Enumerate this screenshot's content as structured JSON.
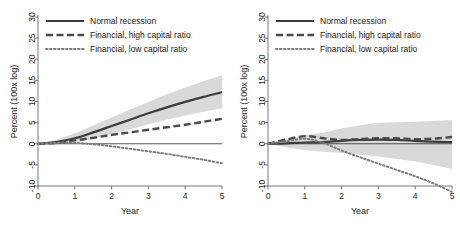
{
  "figure": {
    "panels": [
      {
        "name": "left-panel",
        "legend": [
          {
            "label": "Normal recession",
            "style": "solid"
          },
          {
            "label": "Financial, high capital ratio",
            "style": "dashed"
          },
          {
            "label": "Financial, low capital ratio",
            "style": "dotted"
          }
        ],
        "axes": {
          "xlabel": "Year",
          "ylabel": "Percent (100x log)",
          "xticks": [
            "0",
            "1",
            "2",
            "3",
            "4",
            "5"
          ],
          "yticks": [
            "-10",
            "-5",
            "0",
            "5",
            "10",
            "15",
            "20",
            "25",
            "30"
          ]
        }
      },
      {
        "name": "right-panel",
        "legend": [
          {
            "label": "Normal recession",
            "style": "solid"
          },
          {
            "label": "Financial, high capital ratio",
            "style": "dashed"
          },
          {
            "label": "Financial, low capital ratio",
            "style": "dotted"
          }
        ],
        "axes": {
          "xlabel": "Year",
          "ylabel": "Percent (100x log)",
          "xticks": [
            "0",
            "1",
            "2",
            "3",
            "4",
            "5"
          ],
          "yticks": [
            "-10",
            "-5",
            "0",
            "5",
            "10",
            "15",
            "20",
            "25",
            "30"
          ]
        }
      }
    ]
  },
  "chart_data": [
    {
      "type": "line",
      "panel": "left",
      "title": "",
      "xlabel": "Year",
      "ylabel": "Percent (100x log)",
      "xlim": [
        0,
        5
      ],
      "ylim": [
        -10,
        30
      ],
      "xticks": [
        0,
        1,
        2,
        3,
        4,
        5
      ],
      "yticks": [
        -10,
        -5,
        0,
        5,
        10,
        15,
        20,
        25,
        30
      ],
      "grid": false,
      "legend_position": "top-left",
      "x": [
        0,
        0.5,
        1,
        1.5,
        2,
        2.5,
        3,
        3.5,
        4,
        4.5,
        5
      ],
      "series": [
        {
          "name": "Normal recession",
          "style": "solid",
          "color": "#3c3c3c",
          "values": [
            0.0,
            0.4,
            1.3,
            2.7,
            4.2,
            5.7,
            7.2,
            8.6,
            9.9,
            11.1,
            12.2
          ],
          "band_upper": [
            0.0,
            1.0,
            2.4,
            4.3,
            6.2,
            8.1,
            9.9,
            11.7,
            13.3,
            14.8,
            16.2
          ],
          "band_lower": [
            0.0,
            -0.1,
            0.3,
            1.2,
            2.3,
            3.4,
            4.6,
            5.7,
            6.7,
            7.6,
            8.4
          ]
        },
        {
          "name": "Financial, high capital ratio",
          "style": "dashed",
          "color": "#4a4a4a",
          "values": [
            0.0,
            0.2,
            0.8,
            1.4,
            2.1,
            2.7,
            3.3,
            3.9,
            4.5,
            5.2,
            5.9
          ]
        },
        {
          "name": "Financial, low capital ratio",
          "style": "dotted",
          "color": "#7d7d7d",
          "values": [
            0.0,
            0.2,
            0.2,
            -0.1,
            -0.6,
            -1.2,
            -1.8,
            -2.4,
            -3.1,
            -3.8,
            -4.6
          ]
        }
      ]
    },
    {
      "type": "line",
      "panel": "right",
      "title": "",
      "xlabel": "Year",
      "ylabel": "Percent (100x log)",
      "xlim": [
        0,
        5
      ],
      "ylim": [
        -10,
        30
      ],
      "xticks": [
        0,
        1,
        2,
        3,
        4,
        5
      ],
      "yticks": [
        -10,
        -5,
        0,
        5,
        10,
        15,
        20,
        25,
        30
      ],
      "grid": false,
      "legend_position": "top-left",
      "x": [
        0,
        0.5,
        1,
        1.5,
        2,
        2.5,
        3,
        3.5,
        4,
        4.5,
        5
      ],
      "series": [
        {
          "name": "Normal recession",
          "style": "solid",
          "color": "#3c3c3c",
          "values": [
            0.0,
            0.1,
            0.3,
            0.4,
            0.7,
            0.9,
            1.0,
            0.9,
            0.7,
            0.5,
            0.4
          ],
          "band_upper": [
            0.0,
            1.0,
            2.0,
            2.6,
            3.6,
            4.4,
            5.0,
            5.1,
            5.2,
            5.4,
            5.6
          ],
          "band_lower": [
            0.0,
            -0.9,
            -1.5,
            -1.9,
            -2.2,
            -2.6,
            -3.0,
            -3.6,
            -4.2,
            -5.0,
            -5.9
          ]
        },
        {
          "name": "Financial, high capital ratio",
          "style": "dashed",
          "color": "#4a4a4a",
          "values": [
            0.0,
            1.0,
            1.8,
            1.3,
            0.9,
            1.1,
            1.3,
            1.3,
            1.1,
            1.2,
            1.6
          ]
        },
        {
          "name": "Financial, low capital ratio",
          "style": "dotted",
          "color": "#7d7d7d",
          "values": [
            0.0,
            0.6,
            1.2,
            0.2,
            -1.6,
            -3.2,
            -4.7,
            -6.2,
            -7.7,
            -9.4,
            -11.4
          ]
        }
      ]
    }
  ]
}
